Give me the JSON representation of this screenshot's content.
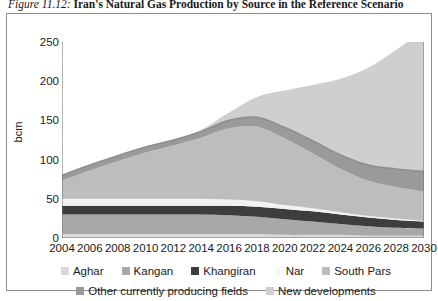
{
  "title": {
    "number": "Figure 11.12:",
    "text": "Iran's Natural Gas Production by Source in the Reference Scenario"
  },
  "colors": {
    "aghar": "#d9d9d9",
    "kangan": "#a8a8a8",
    "khangiran": "#3d3d3d",
    "nar": "#f2f2f2",
    "south_pars": "#bdbdbd",
    "other_currently_producing_fields": "#9a9a9a",
    "new_developments": "#cfcfcf",
    "axis": "#6e6e6e",
    "frame": "#8d8d8d"
  },
  "chart_data": {
    "type": "area",
    "title": "Iran's Natural Gas Production by Source in the Reference Scenario",
    "xlabel": "",
    "ylabel": "bcm",
    "ylim": [
      0,
      250
    ],
    "yticks": [
      0,
      50,
      100,
      150,
      200,
      250
    ],
    "xlim": [
      2004,
      2030
    ],
    "xticks": [
      2004,
      2006,
      2008,
      2010,
      2012,
      2014,
      2016,
      2018,
      2020,
      2022,
      2024,
      2026,
      2028,
      2030
    ],
    "grid": false,
    "legend_position": "bottom",
    "stacked": true,
    "x": [
      2004,
      2006,
      2008,
      2010,
      2012,
      2014,
      2016,
      2018,
      2020,
      2022,
      2024,
      2026,
      2028,
      2030
    ],
    "series": [
      {
        "name": "Aghar",
        "values": [
          5,
          5,
          5,
          5,
          5,
          5,
          5,
          5,
          4,
          4,
          4,
          3,
          3,
          3
        ]
      },
      {
        "name": "Kangan",
        "values": [
          25,
          25,
          25,
          25,
          25,
          25,
          24,
          22,
          20,
          17,
          14,
          12,
          10,
          9
        ]
      },
      {
        "name": "Khangiran",
        "values": [
          11,
          11,
          11,
          11,
          11,
          11,
          12,
          13,
          13,
          13,
          12,
          11,
          10,
          9
        ]
      },
      {
        "name": "Nar",
        "values": [
          9,
          9,
          9,
          9,
          9,
          9,
          8,
          7,
          5,
          4,
          3,
          2,
          2,
          1
        ]
      },
      {
        "name": "South Pars",
        "values": [
          23,
          36,
          48,
          59,
          68,
          78,
          91,
          95,
          85,
          70,
          55,
          45,
          40,
          37
        ]
      },
      {
        "name": "Other currently producing fields",
        "values": [
          7,
          7,
          7,
          7,
          7,
          8,
          10,
          12,
          14,
          16,
          18,
          20,
          23,
          26
        ]
      },
      {
        "name": "New developments",
        "values": [
          0,
          0,
          0,
          0,
          0,
          2,
          10,
          26,
          47,
          71,
          97,
          124,
          152,
          180
        ]
      }
    ],
    "totals": [
      80,
      93,
      105,
      116,
      125,
      138,
      160,
      180,
      188,
      195,
      203,
      217,
      240,
      265
    ]
  },
  "axis": {
    "y_title": "bcm",
    "y_ticks": [
      "250",
      "200",
      "150",
      "100",
      "50",
      "0"
    ],
    "x_ticks": [
      "2004",
      "2006",
      "2008",
      "2010",
      "2012",
      "2014",
      "2016",
      "2018",
      "2020",
      "2022",
      "2024",
      "2026",
      "2028",
      "2030"
    ]
  },
  "legend": {
    "row1": [
      {
        "label": "Aghar",
        "color": "#d9d9d9"
      },
      {
        "label": "Kangan",
        "color": "#a8a8a8"
      },
      {
        "label": "Khangiran",
        "color": "#3d3d3d"
      },
      {
        "label": "Nar",
        "color": "#f7f7f7"
      },
      {
        "label": "South Pars",
        "color": "#bdbdbd"
      }
    ],
    "row2": [
      {
        "label": "Other currently producing fields",
        "color": "#9a9a9a"
      },
      {
        "label": "New developments",
        "color": "#cfcfcf"
      }
    ]
  }
}
